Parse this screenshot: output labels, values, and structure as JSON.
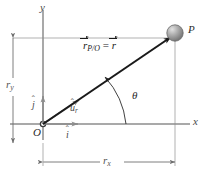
{
  "figure": {
    "width": 207,
    "height": 178,
    "background_color": "#ffffff"
  },
  "axes": {
    "x_label": "x",
    "y_label": "y",
    "origin_label": "O",
    "axis_color": "#8c8c8c",
    "x_axis": {
      "y": 124,
      "x_start": 10,
      "x_end": 190
    },
    "y_axis": {
      "x": 43,
      "y_start": 10,
      "y_end": 140
    }
  },
  "point": {
    "label": "P",
    "cx": 175,
    "cy": 33,
    "r": 8,
    "fill_color": "#9a9a9a",
    "highlight_color": "#d8d8d8"
  },
  "vector": {
    "label_r": "r",
    "label_sub": "P/O",
    "label_equals": "=",
    "label_r2": "r",
    "color": "#1a1a1a",
    "from": {
      "x": 43,
      "y": 124
    },
    "to": {
      "x": 172,
      "y": 36
    }
  },
  "angle": {
    "label": "θ",
    "value_deg": 34,
    "arc_radius": 48,
    "color": "#2b2b2b"
  },
  "unit_vectors": [
    {
      "name": "i-hat",
      "label": "i",
      "hat": "ˆ",
      "color": "#8c8c8c",
      "direction": "x"
    },
    {
      "name": "j-hat",
      "label": "j",
      "hat": "ˆ",
      "color": "#8c8c8c",
      "direction": "y"
    },
    {
      "name": "u-r-hat",
      "label": "u",
      "hat": "ˆ",
      "sub": "r",
      "color": "#8c8c8c",
      "direction": "radial"
    }
  ],
  "dimensions": [
    {
      "name": "r-y",
      "label": "r",
      "sub": "y",
      "orientation": "vertical",
      "x": 13,
      "y_start": 38,
      "y_end": 143,
      "color": "#8c8c8c"
    },
    {
      "name": "r-x",
      "label": "r",
      "sub": "x",
      "orientation": "horizontal",
      "y": 162,
      "x_start": 43,
      "x_end": 175,
      "color": "#8c8c8c"
    }
  ],
  "extension_lines": {
    "color": "#a8a8a8",
    "horizontal": {
      "y": 38,
      "x_start": 13,
      "x_end": 178
    },
    "vertical": {
      "x": 175,
      "y_start": 33,
      "y_end": 166
    }
  }
}
